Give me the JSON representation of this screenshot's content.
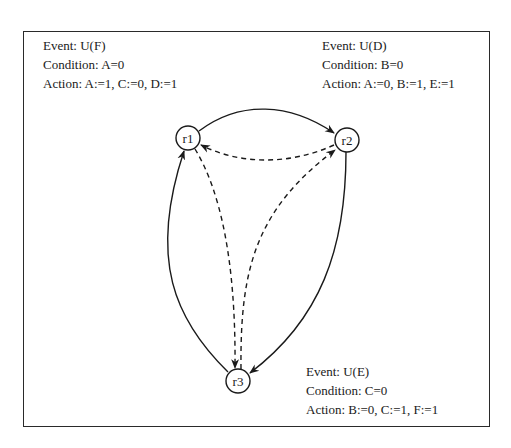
{
  "diagram": {
    "nodes": [
      {
        "id": "r1",
        "label": "r1",
        "cx": 188,
        "cy": 138
      },
      {
        "id": "r2",
        "label": "r2",
        "cx": 347,
        "cy": 140
      },
      {
        "id": "r3",
        "label": "r3",
        "cx": 238,
        "cy": 381
      }
    ],
    "edges": [
      {
        "from": "r1",
        "to": "r2",
        "style": "solid"
      },
      {
        "from": "r2",
        "to": "r1",
        "style": "dashed"
      },
      {
        "from": "r2",
        "to": "r3",
        "style": "solid"
      },
      {
        "from": "r3",
        "to": "r1",
        "style": "solid"
      },
      {
        "from": "r1",
        "to": "r3",
        "style": "dashed"
      },
      {
        "from": "r3",
        "to": "r2",
        "style": "dashed"
      }
    ],
    "rules": {
      "r1": {
        "event": "Event: U(F)",
        "condition": "Condition: A=0",
        "action": "Action: A:=1, C:=0, D:=1"
      },
      "r2": {
        "event": "Event: U(D)",
        "condition": "Condition: B=0",
        "action": "Action: A:=0, B:=1, E:=1"
      },
      "r3": {
        "event": "Event: U(E)",
        "condition": "Condition: C=0",
        "action": "Action: B:=0, C:=1, F:=1"
      }
    }
  }
}
